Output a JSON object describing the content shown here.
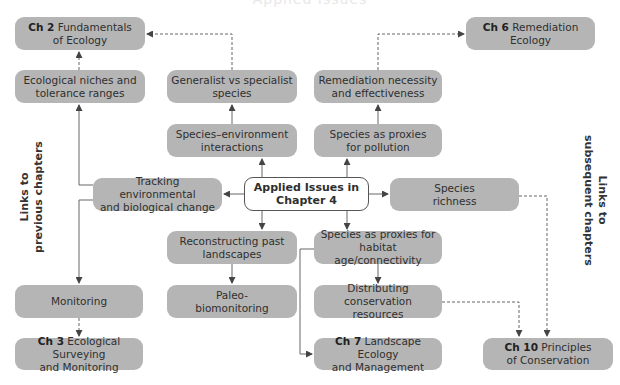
{
  "header": {
    "title_clipped": "Applied Issues"
  },
  "center": {
    "line1": "Applied Issues in",
    "line2": "Chapter 4"
  },
  "side_labels": {
    "left": {
      "line1": "Links to",
      "line2": "previous chapters"
    },
    "right": {
      "line1": "Links to",
      "line2": "subsequent chapters"
    }
  },
  "nodes": {
    "ch2": {
      "prefix": "Ch 2",
      "text": " Fundamentals",
      "line2": "of Ecology"
    },
    "niches": {
      "line1": "Ecological niches and",
      "line2": "tolerance ranges"
    },
    "generalist": {
      "line1": "Generalist vs specialist",
      "line2": "species"
    },
    "remediation": {
      "line1": "Remediation necessity",
      "line2": "and effectiveness"
    },
    "ch6": {
      "prefix": "Ch 6",
      "text": " Remediation",
      "line2": "Ecology"
    },
    "species_env": {
      "line1": "Species–environment",
      "line2": "interactions"
    },
    "proxies_pollution": {
      "line1": "Species as proxies",
      "line2": "for pollution"
    },
    "tracking": {
      "line1": "Tracking environmental",
      "line2": "and biological change"
    },
    "richness": {
      "line1": "Species",
      "line2": "richness"
    },
    "reconstructing": {
      "line1": "Reconstructing past",
      "line2": "landscapes"
    },
    "proxies_habitat": {
      "line1": "Species as proxies for",
      "line2": "habitat age/connectivity"
    },
    "monitoring": {
      "line1": "Monitoring"
    },
    "paleo": {
      "line1": "Paleo-",
      "line2": "biomonitoring"
    },
    "distributing": {
      "line1": "Distributing conservation",
      "line2": "resources"
    },
    "ch3": {
      "prefix": "Ch 3",
      "text": " Ecological Surveying",
      "line2": "and Monitoring"
    },
    "ch7": {
      "prefix": "Ch 7",
      "text": " Landscape Ecology",
      "line2": "and Management"
    },
    "ch10": {
      "prefix": "Ch 10",
      "text": " Principles",
      "line2": "of Conservation"
    }
  },
  "colors": {
    "box_fill": "#b5b5b5",
    "center_fill": "#ffffff",
    "line": "#555555"
  }
}
